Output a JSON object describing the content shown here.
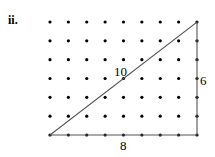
{
  "part_label": "ii.",
  "grid": {
    "cols": 9,
    "rows": 7,
    "x0": 50,
    "x1": 197,
    "y0": 22,
    "y1": 135,
    "dot_color": "#000000"
  },
  "triangle": {
    "stroke": "#555555",
    "hypotenuse_label": "10",
    "vertical_label": "6",
    "base_label": "8"
  }
}
